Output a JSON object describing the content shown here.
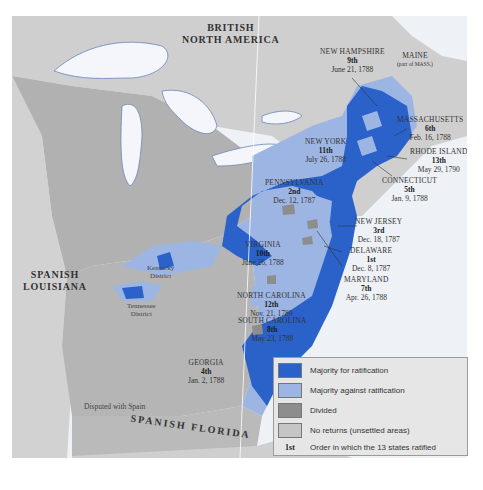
{
  "colors": {
    "for": "#2a62c9",
    "against": "#9db5e3",
    "divided": "#8d8d8d",
    "no_returns": "#c5c5c5",
    "territory": "#b1b1b1",
    "foreign": "#cfcfcf",
    "water": "#eef1f6"
  },
  "regions": {
    "british_north_america": [
      "BRITISH",
      "NORTH AMERICA"
    ],
    "spanish_louisiana": [
      "SPANISH",
      "LOUISIANA"
    ],
    "spanish_florida": "SPANISH FLORIDA",
    "disputed": "Disputed with Spain",
    "kentucky": [
      "Kentucky",
      "District"
    ],
    "tennessee": [
      "Tennessee",
      "District"
    ],
    "maine": [
      "MAINE",
      "(part of MASS.)"
    ]
  },
  "states": [
    {
      "name": "DELAWARE",
      "order": "1st",
      "date": "Dec. 8, 1787"
    },
    {
      "name": "PENNSYLVANIA",
      "order": "2nd",
      "date": "Dec. 12, 1787"
    },
    {
      "name": "NEW JERSEY",
      "order": "3rd",
      "date": "Dec. 18, 1787"
    },
    {
      "name": "GEORGIA",
      "order": "4th",
      "date": "Jan. 2, 1788"
    },
    {
      "name": "CONNECTICUT",
      "order": "5th",
      "date": "Jan. 9, 1788"
    },
    {
      "name": "MASSACHUSETTS",
      "order": "6th",
      "date": "Feb. 16, 1788"
    },
    {
      "name": "MARYLAND",
      "order": "7th",
      "date": "Apr. 26, 1788"
    },
    {
      "name": "SOUTH CAROLINA",
      "order": "8th",
      "date": "May 23, 1788"
    },
    {
      "name": "NEW HAMPSHIRE",
      "order": "9th",
      "date": "June 21, 1788"
    },
    {
      "name": "VIRGINIA",
      "order": "10th",
      "date": "June 26, 1788"
    },
    {
      "name": "NEW YORK",
      "order": "11th",
      "date": "July 26, 1788"
    },
    {
      "name": "NORTH CAROLINA",
      "order": "12th",
      "date": "Nov. 21, 1789"
    },
    {
      "name": "RHODE ISLAND",
      "order": "13th",
      "date": "May 29, 1790"
    }
  ],
  "legend": {
    "items": [
      {
        "label": "Majority for ratification"
      },
      {
        "label": "Majority against ratification"
      },
      {
        "label": "Divided"
      },
      {
        "label": "No returns (unsettled areas)"
      }
    ],
    "order_sample": "1st",
    "order_label": "Order in which the 13 states ratified"
  }
}
